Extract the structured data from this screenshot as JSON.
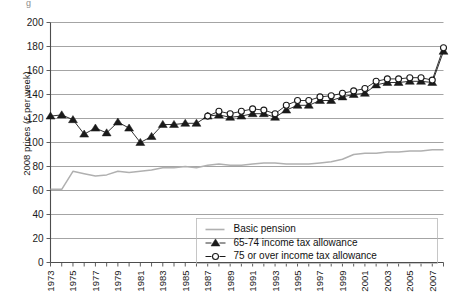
{
  "figure": {
    "caption_stub": "g",
    "ylabel": "2008 prices (£ per week)"
  },
  "chart_data": {
    "type": "line",
    "title": "",
    "subtitle": "",
    "xlabel": "",
    "ylabel": "2008 prices (£ per week)",
    "xlim": [
      1973,
      2008
    ],
    "ylim": [
      0,
      200
    ],
    "ytick_step": 20,
    "yticks": [
      0,
      20,
      40,
      60,
      80,
      100,
      120,
      140,
      160,
      180,
      200
    ],
    "ytick_labels": [
      "0",
      "20",
      "40",
      "60",
      "80",
      "100",
      "120",
      "140",
      "160",
      "180",
      "200"
    ],
    "x": [
      1973,
      1974,
      1975,
      1976,
      1977,
      1978,
      1979,
      1980,
      1981,
      1982,
      1983,
      1984,
      1985,
      1986,
      1987,
      1988,
      1989,
      1990,
      1991,
      1992,
      1993,
      1994,
      1995,
      1996,
      1997,
      1998,
      1999,
      2000,
      2001,
      2002,
      2003,
      2004,
      2005,
      2006,
      2007,
      2008
    ],
    "xtick_labels": [
      "1973",
      "1975",
      "1977",
      "1979",
      "1981",
      "1983",
      "1985",
      "1987",
      "1989",
      "1991",
      "1993",
      "1995",
      "1997",
      "1999",
      "2001",
      "2003",
      "2005",
      "2007"
    ],
    "xtick_label_years": [
      1973,
      1975,
      1977,
      1979,
      1981,
      1983,
      1985,
      1987,
      1989,
      1991,
      1993,
      1995,
      1997,
      1999,
      2001,
      2003,
      2005,
      2007
    ],
    "grid": "horizontal",
    "legend_position": "bottom-right",
    "series": [
      {
        "name": "Basic pension",
        "marker": "none",
        "color": "#b0b0b0",
        "values": [
          61,
          61,
          76,
          74,
          72,
          73,
          76,
          75,
          76,
          77,
          79,
          79,
          80,
          79,
          81,
          82,
          81,
          81,
          82,
          83,
          83,
          82,
          82,
          82,
          83,
          84,
          86,
          90,
          91,
          91,
          92,
          92,
          93,
          93,
          94,
          94
        ]
      },
      {
        "name": "65-74 income tax allowance",
        "marker": "triangle",
        "color": "#1a1a1a",
        "values": [
          122,
          123,
          119,
          107,
          112,
          108,
          117,
          112,
          100,
          105,
          115,
          115,
          116,
          116,
          122,
          123,
          121,
          122,
          124,
          124,
          121,
          127,
          131,
          131,
          135,
          135,
          138,
          140,
          141,
          148,
          150,
          150,
          151,
          151,
          150,
          176
        ]
      },
      {
        "name": "75 or over income tax allowance",
        "marker": "circle",
        "color": "#1a1a1a",
        "values": [
          null,
          null,
          null,
          null,
          null,
          null,
          null,
          null,
          null,
          null,
          null,
          null,
          null,
          null,
          122,
          126,
          124,
          126,
          128,
          127,
          124,
          131,
          135,
          135,
          138,
          139,
          141,
          143,
          145,
          151,
          153,
          153,
          154,
          154,
          152,
          179
        ]
      }
    ],
    "legend": [
      {
        "label": "Basic pension",
        "marker": "line",
        "color": "#b0b0b0"
      },
      {
        "label": "65-74 income tax allowance",
        "marker": "triangle",
        "color": "#1a1a1a"
      },
      {
        "label": "75 or over income tax allowance",
        "marker": "circle",
        "color": "#1a1a1a"
      }
    ]
  }
}
